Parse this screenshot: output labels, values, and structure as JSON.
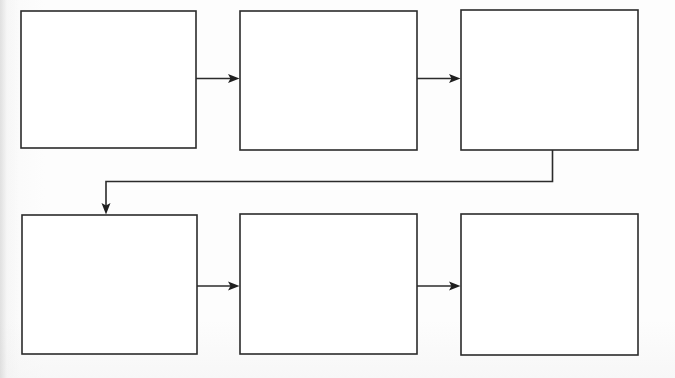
{
  "diagram": {
    "type": "flowchart",
    "orientation": "left-to-right, wrapping to second row",
    "background_color": "#fdfdfd",
    "line_color": "#2b2b2b",
    "box_fill_color": "#ffffff",
    "node_count": 6,
    "connector_count": 5,
    "nodes": [
      {
        "id": "node-1",
        "label": "",
        "row": 1,
        "column": 1,
        "x": 21,
        "y": 11,
        "width": 175,
        "height": 137
      },
      {
        "id": "node-2",
        "label": "",
        "row": 1,
        "column": 2,
        "x": 240,
        "y": 11,
        "width": 177,
        "height": 139
      },
      {
        "id": "node-3",
        "label": "",
        "row": 1,
        "column": 3,
        "x": 461,
        "y": 10,
        "width": 177,
        "height": 140
      },
      {
        "id": "node-4",
        "label": "",
        "row": 2,
        "column": 1,
        "x": 22,
        "y": 215,
        "width": 175,
        "height": 139
      },
      {
        "id": "node-5",
        "label": "",
        "row": 2,
        "column": 2,
        "x": 240,
        "y": 214,
        "width": 177,
        "height": 140
      },
      {
        "id": "node-6",
        "label": "",
        "row": 2,
        "column": 3,
        "x": 461,
        "y": 214,
        "width": 177,
        "height": 141
      }
    ],
    "connectors": [
      {
        "id": "connector-1",
        "from": "node-1",
        "to": "node-2",
        "shape": "straight-horizontal",
        "direction": "right"
      },
      {
        "id": "connector-2",
        "from": "node-2",
        "to": "node-3",
        "shape": "straight-horizontal",
        "direction": "right"
      },
      {
        "id": "connector-3",
        "from": "node-3",
        "to": "node-4",
        "shape": "elbow-wrap",
        "direction": "down"
      },
      {
        "id": "connector-4",
        "from": "node-4",
        "to": "node-5",
        "shape": "straight-horizontal",
        "direction": "right"
      },
      {
        "id": "connector-5",
        "from": "node-5",
        "to": "node-6",
        "shape": "straight-horizontal",
        "direction": "right"
      }
    ]
  }
}
